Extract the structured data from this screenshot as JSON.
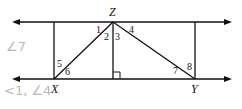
{
  "diagram": {
    "type": "geometry-parallel-lines",
    "points": {
      "Z": "Z",
      "X": "X",
      "Y": "Y"
    },
    "angle_labels": [
      "1",
      "2",
      "3",
      "4",
      "5",
      "6",
      "7",
      "8"
    ],
    "annotations": {
      "right_angle_mark": true,
      "parallel_lines": 2,
      "arrowheads": "both ends of each line"
    },
    "handwritten": {
      "line1": "∠7",
      "line2": "<1, ∠4"
    }
  }
}
